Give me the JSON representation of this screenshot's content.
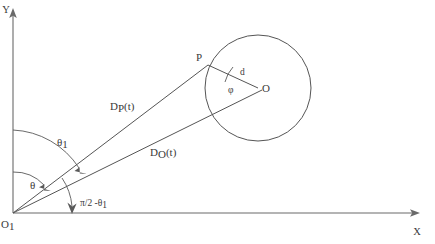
{
  "figure": {
    "type": "geometry-diagram",
    "axes": {
      "y_label": "Y",
      "x_label": "X",
      "origin_label": "O",
      "origin_sub": "1"
    },
    "points": {
      "p_label": "P",
      "o_label": "O"
    },
    "segments": {
      "dp_label": "D",
      "dp_sub": "P",
      "dp_suffix": "(t)",
      "do_label": "D",
      "do_sub": "O",
      "do_suffix": "(t)",
      "radius_label": "d"
    },
    "angles": {
      "theta1_label": "θ",
      "theta1_sub": "1",
      "theta_label": "θ",
      "complement_label": "π/2 -θ",
      "complement_sub": "1",
      "phi_label": "φ"
    },
    "caption": "",
    "colors": {
      "line": "#555555",
      "axis": "#6a6a6a",
      "text": "#3a3a3a",
      "background": "#ffffff"
    }
  }
}
